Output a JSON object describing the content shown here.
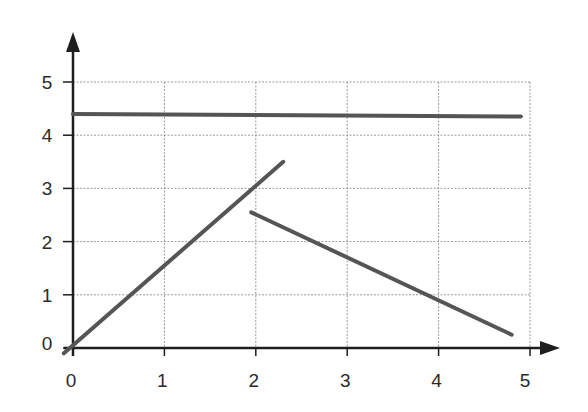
{
  "chart_data": {
    "type": "line",
    "title": "",
    "xlabel": "",
    "ylabel": "",
    "xlim": [
      0,
      5
    ],
    "ylim": [
      0,
      5
    ],
    "x_ticks": [
      "0",
      "1",
      "2",
      "3",
      "4",
      "5"
    ],
    "y_ticks": [
      "0",
      "1",
      "2",
      "3",
      "4",
      "5"
    ],
    "grid": true,
    "legend": null,
    "series": [
      {
        "name": "horizontal-line",
        "x": [
          0,
          4.9
        ],
        "y": [
          4.4,
          4.35
        ]
      },
      {
        "name": "rising-line",
        "x": [
          -0.1,
          2.3
        ],
        "y": [
          -0.1,
          3.5
        ]
      },
      {
        "name": "falling-line",
        "x": [
          1.95,
          4.8
        ],
        "y": [
          2.55,
          0.25
        ]
      }
    ],
    "colors": {
      "axis": "#1e1e1e",
      "grid": "#9a9a9a",
      "line": "#555555",
      "text": "#2a2a2a"
    }
  }
}
